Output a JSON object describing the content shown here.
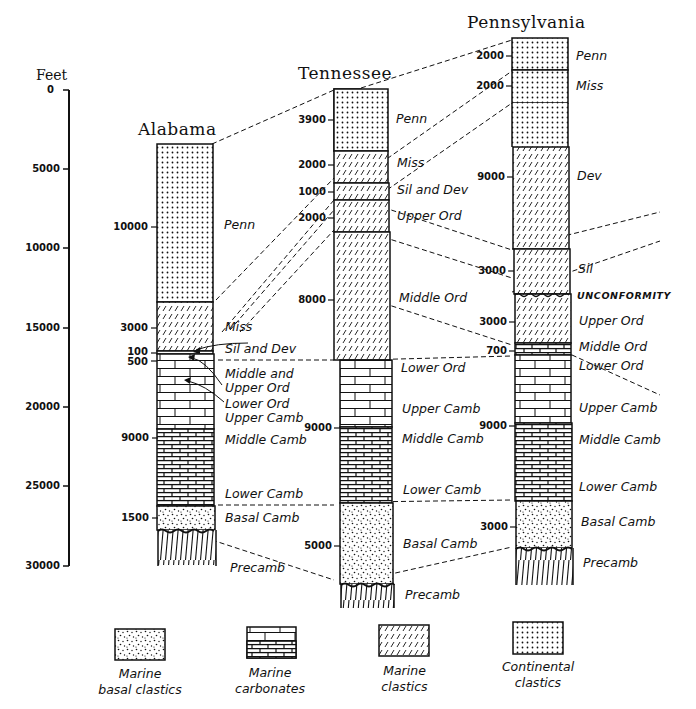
{
  "scale": {
    "unit": "Feet",
    "ticks": [
      "0",
      "5000",
      "10000",
      "15000",
      "20000",
      "25000",
      "30000"
    ]
  },
  "columns": [
    {
      "name": "Alabama",
      "units": [
        {
          "label": "Penn",
          "thickness": "10000",
          "lith": "continental_clastics"
        },
        {
          "label": "Miss",
          "thickness": "3000",
          "lith": "marine_clastics"
        },
        {
          "label": "Sil and Dev",
          "thickness": "100",
          "lith": "marine_clastics"
        },
        {
          "label": "Middle and Upper Ord",
          "thickness": "500",
          "lith": "marine_carbonates"
        },
        {
          "label": "Lower Ord / Upper Camb",
          "thickness": "",
          "lith": "marine_carbonates"
        },
        {
          "label": "Middle Camb",
          "thickness": "9000",
          "lith": "marine_carbonates"
        },
        {
          "label": "Lower Camb",
          "thickness": "",
          "lith": "marine_carbonates"
        },
        {
          "label": "Basal Camb",
          "thickness": "1500",
          "lith": "marine_basal_clastics"
        },
        {
          "label": "Precamb",
          "thickness": "",
          "lith": "precambrian"
        }
      ],
      "labels": {
        "penn": "Penn",
        "miss": "Miss",
        "sil_dev": "Sil and Dev",
        "mid_upper_ord_1": "Middle and",
        "mid_upper_ord_2": "Upper Ord",
        "lower_ord": "Lower Ord",
        "upper_camb": "Upper Camb",
        "middle_camb": "Middle Camb",
        "lower_camb": "Lower Camb",
        "basal_camb": "Basal Camb",
        "precamb": "Precamb"
      },
      "ticks": {
        "t10000": "10000",
        "t3000": "3000",
        "t100": "100",
        "t500": "500",
        "t9000": "9000",
        "t1500": "1500"
      }
    },
    {
      "name": "Tennessee",
      "labels": {
        "penn": "Penn",
        "miss": "Miss",
        "sil_dev": "Sil and Dev",
        "upper_ord": "Upper Ord",
        "middle_ord": "Middle Ord",
        "lower_ord": "Lower Ord",
        "upper_camb": "Upper Camb",
        "middle_camb": "Middle Camb",
        "lower_camb": "Lower Camb",
        "basal_camb": "Basal Camb",
        "precamb": "Precamb"
      },
      "ticks": {
        "t3900": "3900",
        "t2000a": "2000",
        "t1000": "1000",
        "t2000b": "2000",
        "t8000": "8000",
        "t9000": "9000",
        "t5000": "5000"
      }
    },
    {
      "name": "Pennsylvania",
      "labels": {
        "penn": "Penn",
        "miss": "Miss",
        "dev": "Dev",
        "sil": "Sil",
        "unconformity": "UNCONFORMITY",
        "upper_ord": "Upper Ord",
        "middle_ord": "Middle Ord",
        "lower_ord": "Lower Ord",
        "upper_camb": "Upper Camb",
        "middle_camb": "Middle Camb",
        "lower_camb": "Lower Camb",
        "basal_camb": "Basal Camb",
        "precamb": "Precamb"
      },
      "ticks": {
        "t2000a": "2000",
        "t2000b": "2000",
        "t9000a": "9000",
        "t3000a": "3000",
        "t3000b": "3000",
        "t700": "700",
        "t9000b": "9000",
        "t3000c": "3000"
      }
    }
  ],
  "legend": [
    {
      "key": "marine_basal_clastics",
      "line1": "Marine",
      "line2": "basal clastics"
    },
    {
      "key": "marine_carbonates",
      "line1": "Marine",
      "line2": "carbonates"
    },
    {
      "key": "marine_clastics",
      "line1": "Marine",
      "line2": "clastics"
    },
    {
      "key": "continental_clastics",
      "line1": "Continental",
      "line2": "clastics"
    }
  ],
  "colors": {
    "ink": "#111111",
    "paper": "#ffffff"
  }
}
